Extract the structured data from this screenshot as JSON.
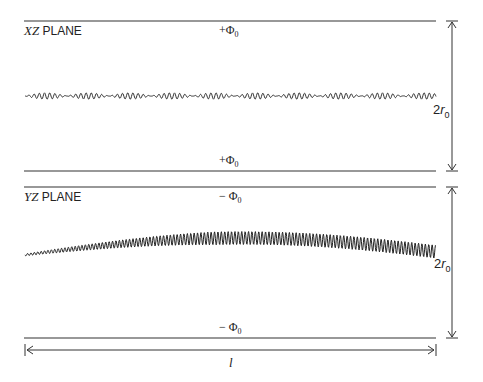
{
  "diagram": {
    "xz_plane": {
      "title_axis": "XZ",
      "title_word": "PLANE",
      "top_electrode": {
        "sign": "+",
        "symbol": "Φ",
        "sub": "0"
      },
      "bottom_electrode": {
        "sign": "+",
        "symbol": "Φ",
        "sub": "0"
      },
      "aperture": {
        "prefix": "2",
        "var": "r",
        "sub": "0"
      },
      "trajectory": "small-amplitude oscillation, constant envelope"
    },
    "yz_plane": {
      "title_axis": "YZ",
      "title_word": "PLANE",
      "top_electrode": {
        "sign": "− ",
        "symbol": "Φ",
        "sub": "0"
      },
      "bottom_electrode": {
        "sign": "− ",
        "symbol": "Φ",
        "sub": "0"
      },
      "aperture": {
        "prefix": "2",
        "var": "r",
        "sub": "0"
      },
      "trajectory": "growing-amplitude oscillation, arched drift"
    },
    "length_label": "l"
  }
}
